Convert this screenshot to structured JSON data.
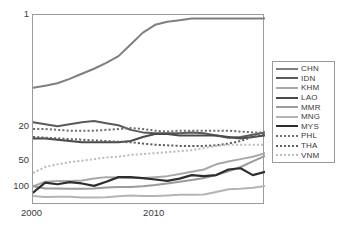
{
  "chart_data": {
    "type": "line",
    "title": "",
    "xlabel": "",
    "ylabel": "",
    "xlim": [
      2000,
      2019
    ],
    "ylim": [
      1,
      160
    ],
    "y_scale": "log-reversed",
    "y_ticks": [
      1,
      20,
      50,
      100
    ],
    "y_tick_labels": [
      "1",
      "20",
      "50",
      "100"
    ],
    "x_ticks": [
      2000,
      2010
    ],
    "x_tick_labels": [
      "2000",
      "2010"
    ],
    "grid": false,
    "legend_position": "right-outside",
    "x": [
      2000,
      2001,
      2002,
      2003,
      2004,
      2005,
      2006,
      2007,
      2008,
      2009,
      2010,
      2011,
      2012,
      2013,
      2014,
      2015,
      2016,
      2017,
      2018,
      2019
    ],
    "series": [
      {
        "name": "CHN",
        "label": "CHN",
        "color": "#7f7f7f",
        "style": "solid",
        "width": 2.0,
        "values": [
          7,
          6.6,
          6.2,
          5.5,
          4.8,
          4.2,
          3.6,
          3.0,
          2.2,
          1.6,
          1.3,
          1.2,
          1.15,
          1.1,
          1.1,
          1.1,
          1.1,
          1.1,
          1.1,
          1.1
        ]
      },
      {
        "name": "IDN",
        "label": "IDN",
        "color": "#5a5a5a",
        "style": "solid",
        "width": 2.0,
        "values": [
          17.5,
          18.5,
          19.5,
          18.5,
          17.5,
          17.0,
          18.0,
          19.0,
          21.5,
          23.0,
          23.5,
          23.5,
          23.5,
          23.0,
          23.5,
          25.0,
          26.5,
          26.0,
          24.5,
          23.0
        ]
      },
      {
        "name": "KHM",
        "label": "KHM",
        "color": "#a8a8a8",
        "style": "solid",
        "width": 2.0,
        "values": [
          97,
          86,
          84,
          84,
          83,
          79,
          76,
          77,
          78,
          78,
          76,
          74,
          70,
          66,
          62,
          54,
          50,
          47,
          44,
          40
        ]
      },
      {
        "name": "LAO",
        "label": "LAO",
        "color": "#4a4a4a",
        "style": "solid",
        "width": 2.0,
        "values": [
          27,
          27,
          28,
          29,
          30,
          30,
          30,
          30,
          29,
          26,
          24,
          24,
          25,
          25,
          25,
          25,
          26,
          27,
          26,
          25
        ]
      },
      {
        "name": "MMR",
        "label": "MMR",
        "color": "#9b9b9b",
        "style": "solid",
        "width": 2.0,
        "values": [
          97,
          103,
          103,
          104,
          104,
          103,
          100,
          99,
          99,
          97,
          94,
          90,
          86,
          82,
          78,
          72,
          65,
          58,
          50,
          43
        ]
      },
      {
        "name": "MNG",
        "label": "MNG",
        "color": "#b4b4b4",
        "style": "solid",
        "width": 2.0,
        "values": [
          126,
          129,
          128,
          128,
          131,
          131,
          130,
          127,
          124,
          126,
          126,
          124,
          122,
          122,
          121,
          113,
          105,
          104,
          101,
          96
        ]
      },
      {
        "name": "MYS",
        "label": "MYS",
        "color": "#2e2e2e",
        "style": "solid",
        "width": 2.2,
        "values": [
          115,
          88,
          92,
          87,
          90,
          96,
          86,
          76,
          76,
          78,
          81,
          84,
          79,
          72,
          74,
          72,
          62,
          60,
          72,
          66
        ]
      },
      {
        "name": "PHL",
        "label": "PHL",
        "color": "#707070",
        "style": "dotted",
        "width": 2.0,
        "values": [
          21,
          21,
          21.5,
          22,
          22,
          22,
          21.5,
          21,
          20.5,
          21,
          22,
          22.5,
          22,
          22,
          22,
          22,
          22,
          22.5,
          23,
          23
        ]
      },
      {
        "name": "THA",
        "label": "THA",
        "color": "#5f5f5f",
        "style": "dotted",
        "width": 2.0,
        "values": [
          26,
          26.5,
          27,
          27.5,
          28,
          28.5,
          29,
          29.5,
          30,
          31,
          32,
          32.5,
          33,
          33,
          33,
          32.5,
          31,
          29,
          26,
          24
        ]
      },
      {
        "name": "VNM",
        "label": "VNM",
        "color": "#bdbdbd",
        "style": "dotted",
        "width": 2.0,
        "values": [
          68,
          58,
          54,
          51,
          49,
          47,
          45,
          44,
          42,
          41,
          40,
          39,
          38,
          37,
          35,
          33,
          32,
          32,
          32,
          32
        ]
      }
    ]
  },
  "axes": {
    "y_labels": [
      "1",
      "20",
      "50",
      "100"
    ],
    "x_labels": [
      "2000",
      "2010"
    ]
  },
  "legend": {
    "entries": [
      {
        "label": "CHN"
      },
      {
        "label": "IDN"
      },
      {
        "label": "KHM"
      },
      {
        "label": "LAO"
      },
      {
        "label": "MMR"
      },
      {
        "label": "MNG"
      },
      {
        "label": "MYS"
      },
      {
        "label": "PHL"
      },
      {
        "label": "THA"
      },
      {
        "label": "VNM"
      }
    ]
  }
}
